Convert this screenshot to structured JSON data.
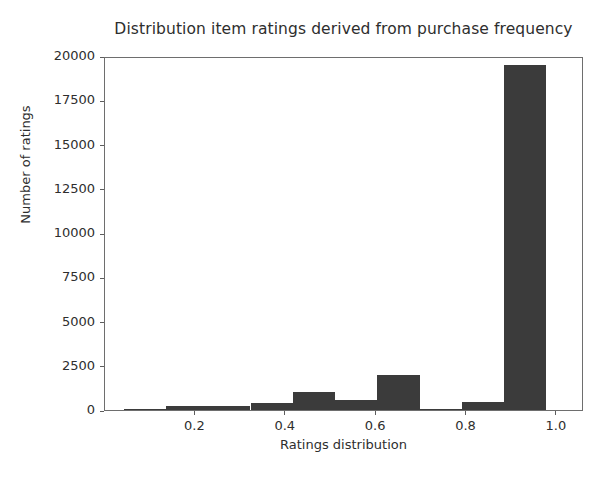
{
  "chart_data": {
    "type": "bar",
    "title": "Distribution item ratings derived from purchase frequency",
    "xlabel": "Ratings distribution",
    "ylabel": "Number of ratings",
    "xlim": [
      0.0,
      1.06
    ],
    "ylim": [
      0,
      20000
    ],
    "grid": false,
    "legend": null,
    "bar_color": "#3b3b3b",
    "axes_color": "#6e6e6e",
    "background_color": "#ffffff",
    "xticks": [
      0.2,
      0.4,
      0.6,
      0.8,
      1.0
    ],
    "xtick_labels": [
      "0.2",
      "0.4",
      "0.6",
      "0.8",
      "1.0"
    ],
    "yticks": [
      0,
      2500,
      5000,
      7500,
      10000,
      12500,
      15000,
      17500,
      20000
    ],
    "ytick_labels": [
      "0",
      "2500",
      "5000",
      "7500",
      "10000",
      "12500",
      "15000",
      "17500",
      "20000"
    ],
    "bins": [
      {
        "x0": 0.042,
        "x1": 0.135,
        "value": 40
      },
      {
        "x0": 0.135,
        "x1": 0.229,
        "value": 230
      },
      {
        "x0": 0.229,
        "x1": 0.322,
        "value": 230
      },
      {
        "x0": 0.322,
        "x1": 0.416,
        "value": 400
      },
      {
        "x0": 0.416,
        "x1": 0.51,
        "value": 1020
      },
      {
        "x0": 0.51,
        "x1": 0.603,
        "value": 560
      },
      {
        "x0": 0.603,
        "x1": 0.697,
        "value": 1980
      },
      {
        "x0": 0.697,
        "x1": 0.79,
        "value": 20
      },
      {
        "x0": 0.79,
        "x1": 0.884,
        "value": 440
      },
      {
        "x0": 0.884,
        "x1": 0.977,
        "value": 19500
      },
      {
        "x0": 0.977,
        "x1": 1.06,
        "value": 0
      }
    ]
  }
}
